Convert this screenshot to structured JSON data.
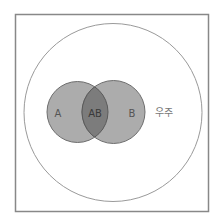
{
  "diagram": {
    "type": "venn",
    "universe": {
      "label": "우주",
      "shape": "circle",
      "stroke": "#9a9a9a"
    },
    "frame": {
      "stroke": "#888888"
    },
    "sets": [
      {
        "id": "A",
        "label": "A",
        "fill": "#acacac",
        "stroke": "#6e6e6e"
      },
      {
        "id": "B",
        "label": "B",
        "fill": "#acacac",
        "stroke": "#6e6e6e"
      }
    ],
    "intersection": {
      "label": "AB",
      "fill": "#7c7c7c"
    }
  }
}
